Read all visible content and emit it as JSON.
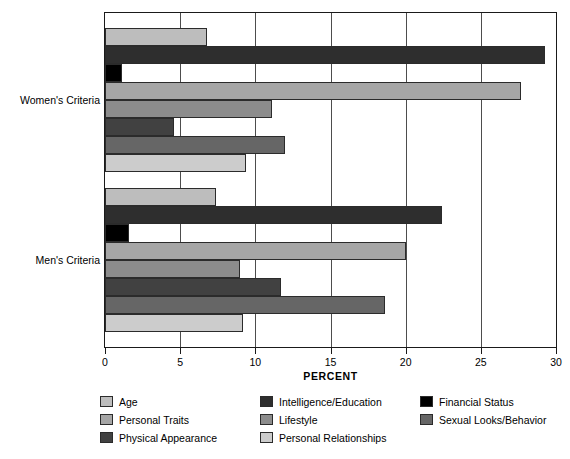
{
  "chart_data": {
    "type": "bar",
    "orientation": "horizontal",
    "title": "",
    "xlabel": "PERCENT",
    "ylabel": "",
    "xlim": [
      0,
      30
    ],
    "xticks": [
      0,
      5,
      10,
      15,
      20,
      25,
      30
    ],
    "grid": true,
    "legend_position": "bottom",
    "categories": [
      "Women's Criteria",
      "Men's Criteria"
    ],
    "series": [
      {
        "name": "Age",
        "color": "#bdbdbd",
        "values": [
          6.8,
          7.4
        ]
      },
      {
        "name": "Intelligence/Education",
        "color": "#2e2e2e",
        "values": [
          29.3,
          22.4
        ]
      },
      {
        "name": "Financial Status",
        "color": "#000000",
        "values": [
          1.1,
          1.6
        ]
      },
      {
        "name": "Personal Traits",
        "color": "#a6a6a6",
        "values": [
          27.7,
          20.0
        ]
      },
      {
        "name": "Lifestyle",
        "color": "#8c8c8c",
        "values": [
          11.1,
          9.0
        ]
      },
      {
        "name": "Physical Appearance",
        "color": "#414141",
        "values": [
          4.6,
          11.7
        ]
      },
      {
        "name": "Sexual Looks/Behavior",
        "color": "#666666",
        "values": [
          12.0,
          18.6
        ]
      },
      {
        "name": "Personal Relationships",
        "color": "#cccccc",
        "values": [
          9.4,
          9.2
        ]
      }
    ]
  },
  "axis": {
    "x_title": "PERCENT",
    "tick_labels": [
      "0",
      "5",
      "10",
      "15",
      "20",
      "25",
      "30"
    ],
    "category_labels": [
      "Women's Criteria",
      "Men's Criteria"
    ]
  },
  "legend": {
    "items": [
      {
        "label": "Age",
        "color": "#bdbdbd"
      },
      {
        "label": "Personal Traits",
        "color": "#a6a6a6"
      },
      {
        "label": "Physical Appearance",
        "color": "#414141"
      },
      {
        "label": "Intelligence/Education",
        "color": "#2e2e2e"
      },
      {
        "label": "Lifestyle",
        "color": "#8c8c8c"
      },
      {
        "label": "Personal Relationships",
        "color": "#cccccc"
      },
      {
        "label": "Financial Status",
        "color": "#000000"
      },
      {
        "label": "Sexual Looks/Behavior",
        "color": "#666666"
      }
    ]
  }
}
